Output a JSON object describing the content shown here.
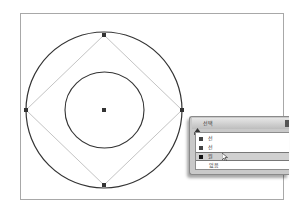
{
  "canvas": {
    "outer_circle": {
      "cx": 104,
      "cy": 110,
      "r": 78,
      "stroke": "#333333"
    },
    "inner_circle": {
      "cx": 104.5,
      "cy": 110,
      "rx": 39.5,
      "ry": 38,
      "stroke": "#333333"
    },
    "square": {
      "points": [
        [
          104,
          35
        ],
        [
          182,
          110
        ],
        [
          104,
          185
        ],
        [
          26,
          110
        ]
      ],
      "stroke": "#c4c4c4"
    },
    "handles": [
      [
        104,
        35
      ],
      [
        182,
        110
      ],
      [
        104,
        185
      ],
      [
        26,
        110
      ],
      [
        104,
        110
      ]
    ],
    "handle_color": "#333333"
  },
  "popup": {
    "title": "선택",
    "items": [
      {
        "label": "선",
        "has_swatch": true,
        "selected": false
      },
      {
        "label": "선",
        "has_swatch": true,
        "selected": false
      },
      {
        "label": "원",
        "has_swatch": true,
        "selected": true
      },
      {
        "label": "없음",
        "has_swatch": false,
        "selected": false
      }
    ]
  }
}
